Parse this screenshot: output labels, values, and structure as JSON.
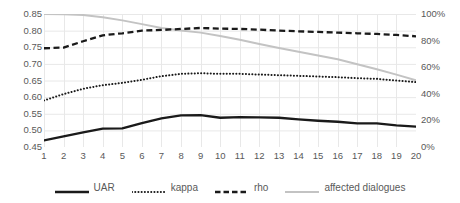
{
  "chart_data": {
    "type": "line",
    "title": "",
    "xlabel": "",
    "ylabel": "",
    "grid": true,
    "legend_position": "bottom",
    "x": [
      1,
      2,
      3,
      4,
      5,
      6,
      7,
      8,
      9,
      10,
      11,
      12,
      13,
      14,
      15,
      16,
      17,
      18,
      19,
      20
    ],
    "xtick_labels": [
      "1",
      "2",
      "3",
      "4",
      "5",
      "6",
      "7",
      "8",
      "9",
      "10",
      "11",
      "12",
      "13",
      "14",
      "15",
      "16",
      "17",
      "18",
      "19",
      "20"
    ],
    "left_axis": {
      "ylim": [
        0.45,
        0.85
      ],
      "tick_step": 0.05,
      "tick_labels": [
        "0.85",
        "0.80",
        "0.75",
        "0.70",
        "0.65",
        "0.60",
        "0.55",
        "0.50",
        "0.45"
      ],
      "tick_values": [
        0.85,
        0.8,
        0.75,
        0.7,
        0.65,
        0.6,
        0.55,
        0.5,
        0.45
      ]
    },
    "right_axis": {
      "ylim": [
        0,
        100
      ],
      "tick_step": 20,
      "tick_labels": [
        "100%",
        "80%",
        "60%",
        "40%",
        "20%",
        "0%"
      ],
      "tick_values": [
        100,
        80,
        60,
        40,
        20,
        0
      ]
    },
    "series": [
      {
        "name": "UAR",
        "axis": "left",
        "style": "solid",
        "color": "#1a1a1a",
        "width": 2.3,
        "values": [
          0.47,
          0.482,
          0.494,
          0.505,
          0.506,
          0.522,
          0.536,
          0.545,
          0.546,
          0.538,
          0.54,
          0.539,
          0.538,
          0.533,
          0.529,
          0.526,
          0.521,
          0.521,
          0.515,
          0.511
        ]
      },
      {
        "name": "kappa",
        "axis": "left",
        "style": "dotted",
        "color": "#1a1a1a",
        "width": 2.0,
        "values": [
          0.59,
          0.609,
          0.625,
          0.636,
          0.643,
          0.652,
          0.663,
          0.67,
          0.672,
          0.67,
          0.67,
          0.668,
          0.666,
          0.664,
          0.662,
          0.66,
          0.657,
          0.655,
          0.65,
          0.645
        ]
      },
      {
        "name": "rho",
        "axis": "left",
        "style": "dashed",
        "color": "#1a1a1a",
        "width": 2.3,
        "values": [
          0.747,
          0.749,
          0.768,
          0.786,
          0.792,
          0.8,
          0.802,
          0.805,
          0.808,
          0.806,
          0.805,
          0.803,
          0.8,
          0.798,
          0.796,
          0.794,
          0.792,
          0.79,
          0.787,
          0.783
        ]
      },
      {
        "name": "affected dialogues",
        "axis": "right",
        "style": "solid",
        "color": "#c3c3c3",
        "width": 2.0,
        "values": [
          100.0,
          99.8,
          99.2,
          97.6,
          95.2,
          92.4,
          89.4,
          87.6,
          86.0,
          83.4,
          80.6,
          77.4,
          74.4,
          71.6,
          68.8,
          66.0,
          62.2,
          58.4,
          54.4,
          50.2
        ]
      }
    ]
  },
  "legend": {
    "items": [
      {
        "label": "UAR",
        "swatch": "solid-line-swatch"
      },
      {
        "label": "kappa",
        "swatch": "dotted-line-swatch"
      },
      {
        "label": "rho",
        "swatch": "dashed-line-swatch"
      },
      {
        "label": "affected dialogues",
        "swatch": "gray-line-swatch"
      }
    ]
  },
  "colors": {
    "grid": "#e8e8e8",
    "text": "#595959",
    "dark_series": "#1a1a1a",
    "light_series": "#c3c3c3",
    "background": "#ffffff"
  }
}
